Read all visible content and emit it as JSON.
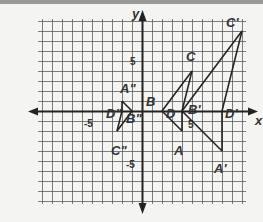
{
  "diagram": {
    "axis_labels": {
      "x": "x",
      "y": "y"
    },
    "ticks": [
      {
        "label": "5",
        "x": 0,
        "y": 5
      },
      {
        "label": "-5",
        "x": 0,
        "y": -5
      },
      {
        "label": "5",
        "x": 5,
        "y": 0
      },
      {
        "label": "-5",
        "x": -5,
        "y": 0
      }
    ],
    "grid": {
      "xmin": -10,
      "xmax": 10,
      "ymin": -9,
      "ymax": 9
    },
    "figures": [
      {
        "name": "original",
        "points": [
          {
            "label": "B",
            "x": 2,
            "y": 0
          },
          {
            "label": "C",
            "x": 5,
            "y": 4
          },
          {
            "label": "D",
            "x": 4,
            "y": 0
          },
          {
            "label": "A",
            "x": 4,
            "y": -2
          }
        ]
      },
      {
        "name": "image-prime",
        "points": [
          {
            "label": "B'",
            "x": 4,
            "y": 0
          },
          {
            "label": "C'",
            "x": 10,
            "y": 8
          },
          {
            "label": "D'",
            "x": 8,
            "y": 0
          },
          {
            "label": "A'",
            "x": 8,
            "y": -4
          }
        ]
      },
      {
        "name": "image-double-prime",
        "points": [
          {
            "label": "B\"",
            "x": -1,
            "y": 0
          },
          {
            "label": "C\"",
            "x": -2.5,
            "y": -2
          },
          {
            "label": "D\"",
            "x": -2,
            "y": 0
          },
          {
            "label": "A\"",
            "x": -2,
            "y": 1
          }
        ]
      }
    ]
  }
}
